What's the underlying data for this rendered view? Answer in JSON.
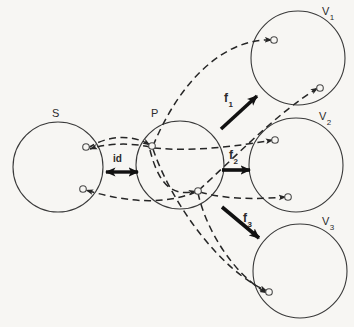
{
  "figure": {
    "background_color": "#f7f6f3",
    "stroke_color": "#3a3a3a",
    "label_color": "#2b2b2b"
  },
  "sets": [
    {
      "id": "S",
      "label": "S",
      "sub": "",
      "cx": 58,
      "cy": 167,
      "r": 45,
      "label_x": 52,
      "label_y": 108
    },
    {
      "id": "P",
      "label": "P",
      "sub": "",
      "cx": 180,
      "cy": 165,
      "r": 44,
      "label_x": 151,
      "label_y": 108
    },
    {
      "id": "V1",
      "label": "V",
      "sub": "1",
      "cx": 298,
      "cy": 58,
      "r": 47,
      "label_x": 322,
      "label_y": 6
    },
    {
      "id": "V2",
      "label": "V",
      "sub": "2",
      "cx": 296,
      "cy": 165,
      "r": 47,
      "label_x": 319,
      "label_y": 111
    },
    {
      "id": "V3",
      "label": "V",
      "sub": "3",
      "cx": 300,
      "cy": 271,
      "r": 47,
      "label_x": 322,
      "label_y": 216
    }
  ],
  "points": [
    {
      "name": "s-upper",
      "set": "S",
      "x": 86,
      "y": 147
    },
    {
      "name": "s-lower",
      "set": "S",
      "x": 83,
      "y": 189
    },
    {
      "name": "p-upper",
      "set": "P",
      "x": 152,
      "y": 146
    },
    {
      "name": "p-lower",
      "set": "P",
      "x": 198,
      "y": 191
    },
    {
      "name": "v1-upper",
      "set": "V1",
      "x": 274,
      "y": 40
    },
    {
      "name": "v1-lower",
      "set": "V1",
      "x": 320,
      "y": 88
    },
    {
      "name": "v2-upper",
      "set": "V2",
      "x": 275,
      "y": 140
    },
    {
      "name": "v2-lower",
      "set": "V2",
      "x": 288,
      "y": 197
    },
    {
      "name": "v3-point",
      "set": "V3",
      "x": 269,
      "y": 292
    }
  ],
  "maps": [
    {
      "name": "id",
      "label": "id",
      "sub": "",
      "style": "double-arrow",
      "from_x": 106,
      "from_y": 172,
      "to_x": 138,
      "to_y": 172,
      "label_x": 113,
      "label_y": 154
    },
    {
      "name": "f1",
      "label": "f",
      "sub": "1",
      "style": "bold-arrow",
      "from_x": 221,
      "from_y": 129,
      "to_x": 257,
      "to_y": 96,
      "label_x": 224,
      "label_y": 92
    },
    {
      "name": "f2",
      "label": "f",
      "sub": "2",
      "style": "bold-arrow",
      "from_x": 222,
      "from_y": 170,
      "to_x": 250,
      "to_y": 170,
      "label_x": 229,
      "label_y": 149
    },
    {
      "name": "f3",
      "label": "f",
      "sub": "3",
      "style": "bold-arrow",
      "from_x": 222,
      "from_y": 207,
      "to_x": 259,
      "to_y": 238,
      "label_x": 243,
      "label_y": 212
    }
  ],
  "dashed_edges": [
    {
      "name": "edge-s-upper-to-p-upper",
      "d": "M 88 148 C 108 135, 132 134, 150 145",
      "arrow_at": "end"
    },
    {
      "name": "edge-p-upper-to-s-upper",
      "d": "M 150 147 C 128 142, 104 144, 90 149",
      "arrow_at": "end"
    },
    {
      "name": "edge-p-lower-to-s-lower",
      "d": "M 196 192 C 160 207, 118 200, 86 190",
      "arrow_at": "end"
    },
    {
      "name": "edge-p-upper-to-v1-upper",
      "d": "M 153 146 C 180 80, 225 38, 272 40",
      "arrow_at": "end"
    },
    {
      "name": "edge-p-upper-to-v2-upper",
      "d": "M 154 148 C 195 152, 238 146, 273 140",
      "arrow_at": "end"
    },
    {
      "name": "edge-p-upper-to-v3-point",
      "d": "M 153 149 C 172 205, 222 272, 267 291",
      "arrow_at": "end"
    },
    {
      "name": "edge-p-lower-to-v1-lower",
      "d": "M 199 190 C 232 160, 278 112, 318 88",
      "arrow_at": "end"
    },
    {
      "name": "edge-p-lower-to-v2-lower",
      "d": "M 200 192 C 228 200, 258 199, 286 197",
      "arrow_at": "end"
    },
    {
      "name": "edge-p-lower-to-v3-point",
      "d": "M 198 193 C 206 230, 234 275, 267 293",
      "arrow_at": "end"
    },
    {
      "name": "edge-v-back-to-p-lower",
      "d": "M 150 150 C 160 190, 176 196, 196 191",
      "arrow_at": "end"
    }
  ]
}
